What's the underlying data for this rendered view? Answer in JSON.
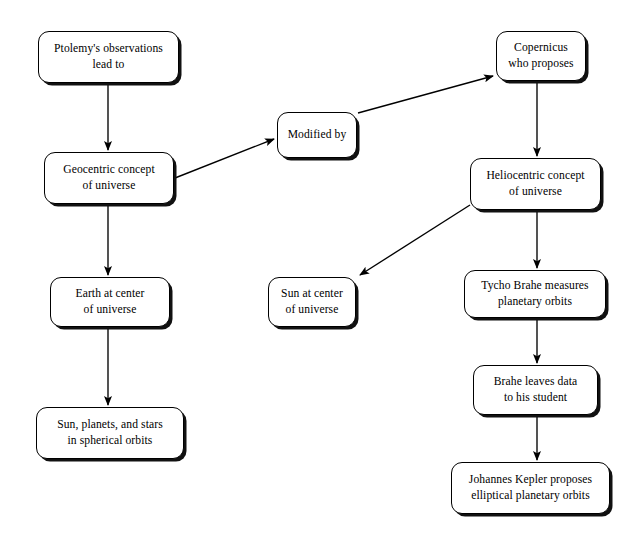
{
  "diagram": {
    "type": "flowchart",
    "background_color": "#ffffff",
    "node_fill_color": "#ffffff",
    "node_border_color": "#000000",
    "edge_color": "#000000",
    "text_color": "#000000",
    "nodes": [
      {
        "id": "ptolemy",
        "label": "Ptolemy's observations\nlead to",
        "x": 38,
        "y": 31,
        "w": 141,
        "h": 52
      },
      {
        "id": "geocentric",
        "label": "Geocentric concept\nof universe",
        "x": 44,
        "y": 152,
        "h": 52,
        "w": 130
      },
      {
        "id": "earth-center",
        "label": "Earth at center\nof universe",
        "x": 50,
        "y": 277,
        "w": 120,
        "h": 50
      },
      {
        "id": "spherical-orbits",
        "label": "Sun, planets, and stars\nin spherical orbits",
        "x": 36,
        "y": 407,
        "w": 148,
        "h": 52
      },
      {
        "id": "modified-by",
        "label": "Modified by",
        "x": 277,
        "y": 112,
        "w": 80,
        "h": 46
      },
      {
        "id": "sun-center",
        "label": "Sun at center\nof universe",
        "x": 268,
        "y": 277,
        "w": 88,
        "h": 50
      },
      {
        "id": "copernicus",
        "label": "Copernicus\nwho proposes",
        "x": 496,
        "y": 31,
        "w": 90,
        "h": 50
      },
      {
        "id": "heliocentric",
        "label": "Heliocentric concept\nof universe",
        "x": 470,
        "y": 158,
        "w": 131,
        "h": 52
      },
      {
        "id": "tycho-brahe",
        "label": "Tycho Brahe measures\nplanetary orbits",
        "x": 464,
        "y": 270,
        "w": 142,
        "h": 48
      },
      {
        "id": "brahe-data",
        "label": "Brahe leaves data\nto his student",
        "x": 473,
        "y": 365,
        "w": 125,
        "h": 50
      },
      {
        "id": "kepler",
        "label": "Johannes Kepler proposes\nelliptical planetary orbits",
        "x": 451,
        "y": 462,
        "w": 159,
        "h": 52
      }
    ],
    "edges": [
      {
        "id": "ptolemy-to-geocentric",
        "from": "ptolemy",
        "to": "geocentric",
        "x1": 108,
        "y1": 83,
        "x2": 108,
        "y2": 150
      },
      {
        "id": "geocentric-to-earth",
        "from": "geocentric",
        "to": "earth-center",
        "x1": 108,
        "y1": 204,
        "x2": 108,
        "y2": 275
      },
      {
        "id": "earth-to-spherical",
        "from": "earth-center",
        "to": "spherical-orbits",
        "x1": 108,
        "y1": 327,
        "x2": 108,
        "y2": 405
      },
      {
        "id": "geocentric-to-modified",
        "from": "geocentric",
        "to": "modified-by",
        "x1": 175,
        "y1": 178,
        "x2": 274,
        "y2": 139
      },
      {
        "id": "modified-to-copernicus",
        "from": "modified-by",
        "to": "copernicus",
        "x1": 358,
        "y1": 113,
        "x2": 493,
        "y2": 76
      },
      {
        "id": "copernicus-to-heliocentric",
        "from": "copernicus",
        "to": "heliocentric",
        "x1": 537,
        "y1": 81,
        "x2": 537,
        "y2": 156
      },
      {
        "id": "heliocentric-to-sun",
        "from": "heliocentric",
        "to": "sun-center",
        "x1": 470,
        "y1": 205,
        "x2": 360,
        "y2": 275
      },
      {
        "id": "heliocentric-to-tycho",
        "from": "heliocentric",
        "to": "tycho-brahe",
        "x1": 537,
        "y1": 210,
        "x2": 537,
        "y2": 268
      },
      {
        "id": "tycho-to-brahe-data",
        "from": "tycho-brahe",
        "to": "brahe-data",
        "x1": 537,
        "y1": 318,
        "x2": 537,
        "y2": 363
      },
      {
        "id": "brahe-data-to-kepler",
        "from": "brahe-data",
        "to": "kepler",
        "x1": 537,
        "y1": 415,
        "x2": 537,
        "y2": 460
      }
    ]
  }
}
